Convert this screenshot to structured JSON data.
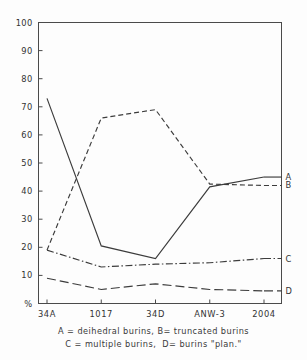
{
  "chart_data": {
    "type": "line",
    "title": "",
    "xlabel": "",
    "ylabel": "%",
    "categories": [
      "34A",
      "1017",
      "34D",
      "ANW-3",
      "2004"
    ],
    "ylim": [
      0,
      100
    ],
    "yticks": [
      "%",
      "10",
      "20",
      "30",
      "40",
      "50",
      "60",
      "70",
      "80",
      "90",
      "100"
    ],
    "grid": false,
    "legend_position": "right-inline",
    "series": [
      {
        "name": "A",
        "label": "A",
        "style": "solid",
        "values": [
          73,
          20.5,
          16,
          41.5,
          45
        ]
      },
      {
        "name": "B",
        "label": "B",
        "style": "dashed",
        "values": [
          19,
          66,
          69,
          42.5,
          42
        ]
      },
      {
        "name": "C",
        "label": "C",
        "style": "dash-dot",
        "values": [
          19,
          13,
          14,
          14.5,
          16
        ]
      },
      {
        "name": "D",
        "label": "D",
        "style": "long-dash",
        "values": [
          9,
          5,
          7,
          5,
          4.5
        ]
      }
    ],
    "annotations": [
      "A = deihedral burins, B= truncated burins",
      "C = multiple burins,  D= burins \"plan.\""
    ]
  },
  "caption": {
    "line1": "A = deihedral burins, B= truncated burins",
    "line2": "C = multiple burins,  D= burins \"plan.\""
  },
  "colors": {
    "line": "#3c3c3c",
    "frame": "#4a4a4a",
    "text": "#333333",
    "background": "#fdfdfd"
  }
}
